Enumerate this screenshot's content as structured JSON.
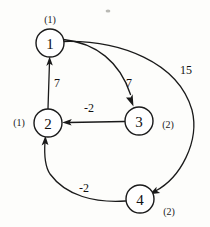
{
  "diagram": {
    "type": "node-link-diagram",
    "colors": {
      "background": "#fdfdfb",
      "stroke": "#1a1a1a",
      "node_fill": "#ffffff",
      "text": "#111111"
    },
    "nodes": [
      {
        "id": "1",
        "label": "1",
        "annotation": "(1)",
        "cx": 50,
        "cy": 43,
        "r": 14,
        "annot_x": 50,
        "annot_y": 19
      },
      {
        "id": "2",
        "label": "2",
        "annotation": "(1)",
        "cx": 48,
        "cy": 123,
        "r": 14,
        "annot_x": 19,
        "annot_y": 122
      },
      {
        "id": "3",
        "label": "3",
        "annotation": "(2)",
        "cx": 139,
        "cy": 121,
        "r": 14,
        "annot_x": 168,
        "annot_y": 124
      },
      {
        "id": "4",
        "label": "4",
        "annotation": "(2)",
        "cx": 140,
        "cy": 199,
        "r": 14,
        "annot_x": 169,
        "annot_y": 211
      }
    ],
    "edges": [
      {
        "id": "e-2-1",
        "from": "2",
        "to": "1",
        "weight": "7",
        "label_x": 57,
        "label_y": 83
      },
      {
        "id": "e-1-3",
        "from": "1",
        "to": "3",
        "weight": "7",
        "label_x": 129,
        "label_y": 83
      },
      {
        "id": "e-3-2",
        "from": "3",
        "to": "2",
        "weight": "-2",
        "label_x": 89,
        "label_y": 108
      },
      {
        "id": "e-1-4",
        "from": "1",
        "to": "4",
        "weight": "15",
        "label_x": 186,
        "label_y": 70
      },
      {
        "id": "e-4-2",
        "from": "4",
        "to": "2",
        "weight": "-2",
        "label_x": 84,
        "label_y": 188
      }
    ]
  }
}
